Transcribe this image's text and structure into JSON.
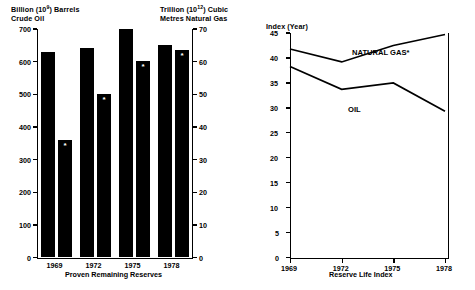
{
  "chart_data": [
    {
      "type": "bar",
      "title": "Proven Remaining Reserves",
      "categories": [
        "1969",
        "1972",
        "1975",
        "1978"
      ],
      "xlabel": "Proven Remaining Reserves",
      "ylabel_left_line1": "Billion (10",
      "ylabel_left_sup": "9",
      "ylabel_left_line1_end": ") Barrels",
      "ylabel_left_line2": "Crude Oil",
      "ylabel_right_line1": "Trillion (10",
      "ylabel_right_sup": "12",
      "ylabel_right_line1_end": ") Cubic",
      "ylabel_right_line2": "Metres Natural Gas",
      "ylim_left": [
        0,
        700
      ],
      "ylim_right": [
        0,
        70
      ],
      "yticks_left": [
        "700",
        "600",
        "500",
        "400",
        "300",
        "200",
        "100",
        "0"
      ],
      "yticks_right": [
        "70",
        "60",
        "50",
        "40",
        "30",
        "20",
        "10",
        "0"
      ],
      "grid": false,
      "legend": "none",
      "series": [
        {
          "name": "Crude Oil",
          "axis": "left",
          "marker": "",
          "values": [
            628,
            640,
            700,
            648
          ]
        },
        {
          "name": "Natural Gas",
          "axis": "right",
          "marker": "*",
          "values": [
            36,
            50,
            60,
            63.5
          ]
        }
      ]
    },
    {
      "type": "line",
      "title": "Reserve Life Index",
      "xlabel": "Reserve Life Index",
      "ylabel": "Index (Year)",
      "x": [
        "1969",
        "1972",
        "1975",
        "1978"
      ],
      "ylim": [
        0,
        45
      ],
      "yticks": [
        "45",
        "40",
        "35",
        "30",
        "25",
        "20",
        "15",
        "10",
        "5",
        "0"
      ],
      "grid": false,
      "legend": "inline-annotations",
      "series": [
        {
          "name": "NATURAL GAS*",
          "label": "NATURAL GAS*",
          "values": [
            41.8,
            39.2,
            42.5,
            44.7
          ]
        },
        {
          "name": "OIL",
          "label": "OIL",
          "values": [
            38.3,
            33.7,
            35.0,
            29.3
          ]
        }
      ]
    }
  ],
  "colors": {
    "ink": "#000000",
    "background": "#ffffff",
    "bar_fill": "#000000",
    "star_marker": "#ffffff"
  }
}
